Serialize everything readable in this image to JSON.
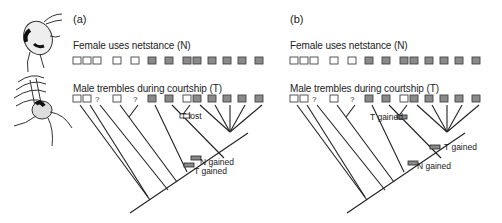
{
  "panels": [
    {
      "label": "(a)",
      "n_label": "Female uses netstance (N)",
      "t_label": "Male trembles during courtship (T)",
      "annotations": [
        "T lost",
        "N gained",
        "T gained"
      ]
    },
    {
      "label": "(b)",
      "n_label": "Female uses netstance (N)",
      "t_label": "Male trembles during courtship (T)",
      "annotations": [
        "T gained",
        "T gained",
        "N gained"
      ]
    }
  ],
  "tip_states": {
    "N": [
      "open",
      "open",
      "open",
      "open",
      "open",
      "filled",
      "filled",
      "filled",
      "filled",
      "filled",
      "filled",
      "filled",
      "filled"
    ],
    "T": [
      "open",
      "open",
      "?",
      "open",
      "?",
      "filled",
      "filled",
      "open",
      "filled",
      "filled",
      "filled",
      "filled",
      "filled"
    ]
  },
  "illustrations": [
    {
      "name": "female-spider"
    },
    {
      "name": "male-spider-trembling"
    }
  ],
  "colors": {
    "filled_box": "#8a8a8a",
    "open_box": "#ffffff",
    "stroke": "#222222"
  }
}
